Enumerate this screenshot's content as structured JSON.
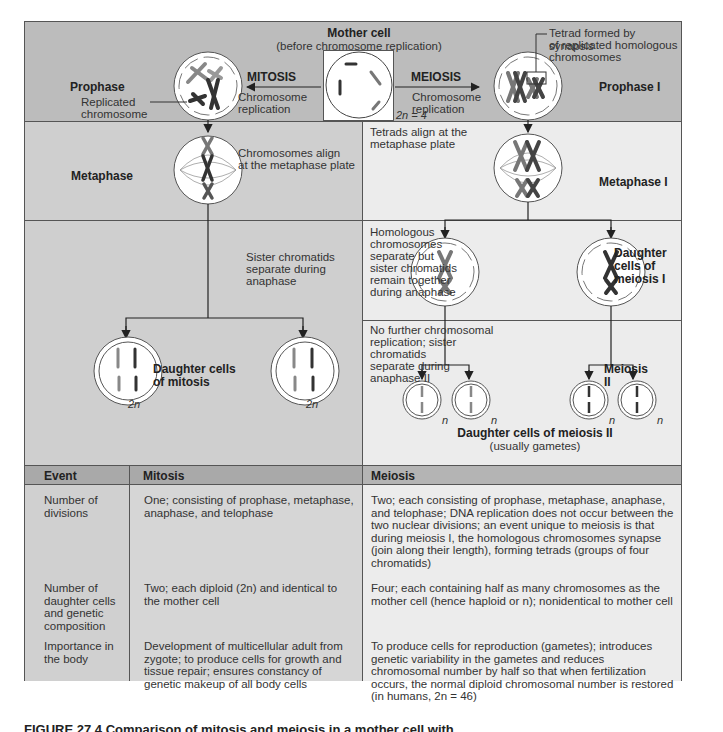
{
  "diagram": {
    "mother_cell": {
      "title": "Mother cell",
      "subtitle": "(before chromosome replication)",
      "ploidy_label": "2n = 4"
    },
    "mitosis": {
      "arrow_label": "MITOSIS",
      "arrow_sublabel_1": "Chromosome",
      "arrow_sublabel_2": "replication",
      "prophase_label": "Prophase",
      "replicated_chromosome_label_1": "Replicated",
      "replicated_chromosome_label_2": "chromosome",
      "metaphase_label": "Metaphase",
      "metaphase_note_1": "Chromosomes align",
      "metaphase_note_2": "at the metaphase plate",
      "anaphase_note_1": "Sister chromatids",
      "anaphase_note_2": "separate during",
      "anaphase_note_3": "anaphase",
      "daughter_label_1": "Daughter cells",
      "daughter_label_2": "of mitosis",
      "daughter_ploidy": "2n"
    },
    "meiosis": {
      "arrow_label": "MEIOSIS",
      "arrow_sublabel_1": "Chromosome",
      "arrow_sublabel_2": "replication",
      "tetrad_note_1": "Tetrad formed by synapsis",
      "tetrad_note_2": "of replicated homologous",
      "tetrad_note_3": "chromosomes",
      "prophase_label": "Prophase I",
      "metaphase_note_1": "Tetrads align at the",
      "metaphase_note_2": "metaphase plate",
      "metaphase_label": "Metaphase I",
      "anaphase_note_1": "Homologous",
      "anaphase_note_2": "chromosomes",
      "anaphase_note_3": "separate but",
      "anaphase_note_4": "sister chromatids",
      "anaphase_note_5": "remain together",
      "anaphase_note_6": "during anaphase",
      "daughter1_label_1": "Daughter",
      "daughter1_label_2": "cells of",
      "daughter1_label_3": "meiosis I",
      "meiosis2_note_1": "No further chromosomal",
      "meiosis2_note_2": "replication; sister",
      "meiosis2_note_3": "chromatids",
      "meiosis2_note_4": "separate during",
      "meiosis2_note_5": "anaphase II",
      "meiosis2_label": "Meiosis II",
      "daughter2_label": "Daughter cells of meiosis II",
      "daughter2_sublabel": "(usually gametes)",
      "daughter2_ploidy": "n"
    }
  },
  "table": {
    "headers": [
      "Event",
      "Mitosis",
      "Meiosis"
    ],
    "rows": [
      {
        "event": "Number of divisions",
        "mitosis": "One; consisting of prophase, metaphase, anaphase, and telophase",
        "meiosis": "Two; each consisting of prophase, metaphase, anaphase, and telophase; DNA replication does not occur between the two nuclear divisions; an event unique to meiosis is that during meiosis I, the homologous chromosomes synapse (join along their length), forming tetrads (groups of four chromatids)"
      },
      {
        "event": "Number of daughter cells and genetic composition",
        "mitosis": "Two; each diploid (2n) and identical to the mother cell",
        "meiosis": "Four; each containing half as many chromosomes as the mother cell (hence haploid or n); nonidentical to mother cell"
      },
      {
        "event": "Importance in the body",
        "mitosis": "Development of multicellular adult from zygote; to produce cells for growth and tissue repair; ensures constancy of genetic makeup of all body cells",
        "meiosis": "To produce cells for reproduction (gametes); introduces genetic variability in the gametes and reduces chromosomal number by half so that when fertilization occurs, the normal diploid chromosomal number is restored (in humans, 2n = 46)"
      }
    ]
  },
  "caption": "FIGURE 27.4 Comparison of mitosis and meiosis in a mother cell with"
}
